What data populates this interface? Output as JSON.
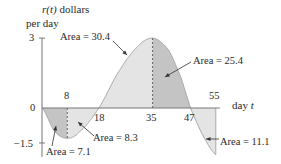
{
  "chart_data": {
    "type": "area",
    "title": "",
    "ylabel": "r(t) dollars per day",
    "ylabel_line1_func": "r(t)",
    "ylabel_line1_rest": " dollars",
    "ylabel_line2": "per day",
    "xlabel": "day t",
    "xlabel_text": "day ",
    "xlabel_var": "t",
    "ylim": [
      -2.2,
      3
    ],
    "xlim": [
      0,
      55
    ],
    "y_ticks": [
      {
        "value": 3,
        "label": "3"
      },
      {
        "value": 0,
        "label": "0"
      },
      {
        "value": -1.5,
        "label": "−1.5"
      }
    ],
    "x_ticks": [
      {
        "value": 8,
        "label": "8",
        "position": "above"
      },
      {
        "value": 18,
        "label": "18",
        "position": "below"
      },
      {
        "value": 35,
        "label": "35",
        "position": "below"
      },
      {
        "value": 47,
        "label": "47",
        "position": "below"
      },
      {
        "value": 55,
        "label": "55",
        "position": "above"
      }
    ],
    "curve": {
      "x": [
        0,
        4,
        8,
        12,
        18,
        24,
        30,
        35,
        40,
        44,
        47,
        51,
        55
      ],
      "y": [
        0,
        -1.0,
        -1.3,
        -1.0,
        0,
        1.5,
        2.6,
        3.0,
        2.5,
        1.3,
        0,
        -1.2,
        -2.0
      ]
    },
    "regions": [
      {
        "from": 0,
        "to": 8,
        "area": 7.1,
        "sign": "negative",
        "shade": "dark"
      },
      {
        "from": 8,
        "to": 18,
        "area": 8.3,
        "sign": "negative",
        "shade": "light"
      },
      {
        "from": 18,
        "to": 35,
        "area": 30.4,
        "sign": "positive",
        "shade": "light"
      },
      {
        "from": 35,
        "to": 47,
        "area": 25.4,
        "sign": "positive",
        "shade": "dark"
      },
      {
        "from": 47,
        "to": 55,
        "area": 11.1,
        "sign": "negative",
        "shade": "light"
      }
    ],
    "dashed_lines_at": [
      8,
      35
    ],
    "annotations": [
      {
        "text": "Area = 7.1",
        "region": "0-8"
      },
      {
        "text": "Area = 8.3",
        "region": "8-18"
      },
      {
        "text": "Area = 30.4",
        "region": "18-35"
      },
      {
        "text": "Area = 25.4",
        "region": "35-47"
      },
      {
        "text": "Area = 11.1",
        "region": "47-55"
      }
    ],
    "grid": false,
    "legend": null,
    "colors": {
      "light": "#e4e4e4",
      "dark": "#c4c4c4",
      "axis": "#777777",
      "curve": "#a8a8a8"
    }
  }
}
